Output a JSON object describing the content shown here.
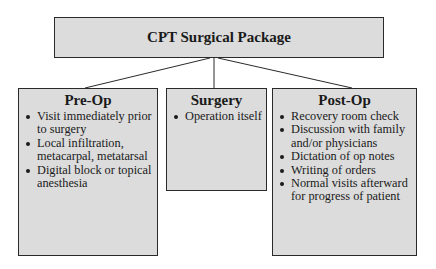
{
  "diagram": {
    "title": "CPT Surgical Package",
    "columns": [
      {
        "heading": "Pre-Op",
        "items": [
          "Visit immediately prior to surgery",
          "Local infiltration, metacarpal, metatarsal",
          "Digital block or topical anesthesia"
        ]
      },
      {
        "heading": "Surgery",
        "items": [
          "Operation itself"
        ]
      },
      {
        "heading": "Post-Op",
        "items": [
          "Recovery room check",
          "Discussion with family and/or physicians",
          "Dictation of op notes",
          "Writing of orders",
          "Normal visits afterward for progress of patient"
        ]
      }
    ]
  }
}
